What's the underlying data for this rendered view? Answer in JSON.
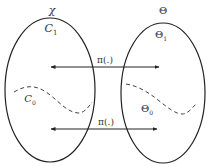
{
  "diagram": {
    "left_set": {
      "label": "χ",
      "upper_region": "C",
      "upper_region_sub": "1",
      "lower_region": "C",
      "lower_region_sub": "0"
    },
    "right_set": {
      "label": "Θ",
      "upper_region": "Θ",
      "upper_region_sub": "1",
      "lower_region": "Θ",
      "lower_region_sub": "0"
    },
    "arrows": [
      {
        "label": "π(.)",
        "position": "upper"
      },
      {
        "label": "π(.)",
        "position": "lower"
      }
    ],
    "colors": {
      "stroke": "#222222",
      "dashed": "#444444",
      "text": "#333333"
    }
  }
}
